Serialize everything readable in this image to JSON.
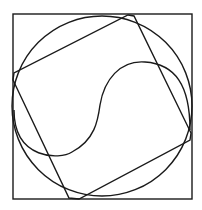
{
  "diagram": {
    "colors": {
      "stroke": "#1a1a1a",
      "background": "#ffffff"
    },
    "outer_square": {
      "x": 13,
      "y": 14,
      "width": 179,
      "height": 185
    },
    "circle": {
      "cx": 102,
      "cy": 106,
      "r": 90
    },
    "tilted_square": {
      "points": "128,15 134,16 191,133 190,140 79,199 69,198 13,80 14,73"
    },
    "s_curve": {
      "path": "M 14 110 C 14 160, 60 160, 72 152 C 95 140, 98 120, 100 105 C 104 80, 120 60, 145 62 C 175 64, 190 85, 190 130"
    }
  }
}
